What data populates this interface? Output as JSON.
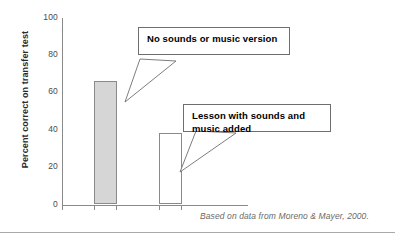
{
  "chart_data": {
    "type": "bar",
    "title": "",
    "xlabel": "",
    "ylabel": "Percent correct on transfer test",
    "ylim": [
      0,
      100
    ],
    "yticks": [
      0,
      20,
      40,
      60,
      80,
      100
    ],
    "grid": false,
    "legend_position": "none",
    "categories": [
      "No sounds or music version",
      "Lesson with sounds and music added"
    ],
    "values": [
      66,
      38
    ],
    "bar_styles": [
      "filled-gray",
      "open-white"
    ],
    "annotations": [
      {
        "id": "callout-no-sounds",
        "text": "No sounds or music version",
        "points_to_category": "No sounds or music version"
      },
      {
        "id": "callout-with-sounds",
        "line1": "Lesson with sounds and",
        "line2": "music added",
        "points_to_category": "Lesson with sounds and music added"
      }
    ],
    "source_note": "Based on data from Moreno & Mayer, 2000."
  },
  "axis": {
    "y_title": "Percent correct on transfer test",
    "tick_100": "100",
    "tick_80": "80",
    "tick_60": "60",
    "tick_40": "40",
    "tick_20": "20",
    "tick_0": "0"
  },
  "callouts": {
    "first_text": "No sounds or music version",
    "second_line1": "Lesson with sounds and",
    "second_line2": "music added"
  },
  "footer": {
    "source": "Based on data from Moreno & Mayer, 2000."
  },
  "colors": {
    "bar_fill": "#d6d6d6",
    "bar_stroke": "#8a8a8a",
    "axis": "#8a8a8a",
    "callout_border": "#6e6e6e",
    "text": "#2b2b2b",
    "source_text": "#6a6a6a"
  }
}
